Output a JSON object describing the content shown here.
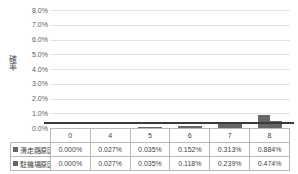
{
  "chart_data": {
    "type": "bar",
    "title": "",
    "xlabel": "",
    "ylabel": "確率",
    "ylim": [
      0,
      0.08
    ],
    "ytick_labels": [
      "8.0%",
      "7.0%",
      "6.0%",
      "5.0%",
      "4.0%",
      "3.0%",
      "2.0%",
      "1.0%",
      "0.0%"
    ],
    "ytick_values": [
      0.08,
      0.07,
      0.06,
      0.05,
      0.04,
      0.03,
      0.02,
      0.01,
      0.0
    ],
    "grid": true,
    "legend_position": "data-table",
    "categories": [
      "0",
      "4",
      "5",
      "6",
      "7",
      "8"
    ],
    "series": [
      {
        "name": "滑走路原因",
        "color": "#666666",
        "values": [
          0.0,
          0.00027,
          0.00035,
          0.00152,
          0.00313,
          0.00884
        ],
        "labels": [
          "0.000%",
          "0.027%",
          "0.035%",
          "0.152%",
          "0.313%",
          "0.884%"
        ]
      },
      {
        "name": "駐機場原因",
        "color": "#666666",
        "values": [
          0.0,
          0.00027,
          0.00035,
          0.00118,
          0.00239,
          0.00474
        ],
        "labels": [
          "0.000%",
          "0.027%",
          "0.035%",
          "0.118%",
          "0.239%",
          "0.474%"
        ]
      }
    ],
    "annotations": [
      {
        "name": "reference-line",
        "type": "hline",
        "value": 0.01,
        "label": "1.0%",
        "color": "#3a3a3a"
      }
    ]
  },
  "colors": {
    "bar": "#666666",
    "gridline": "#e2e2e2",
    "reference_line": "#3a3a3a",
    "table_border": "#b8b8b8",
    "text": "#3f3f3f"
  }
}
